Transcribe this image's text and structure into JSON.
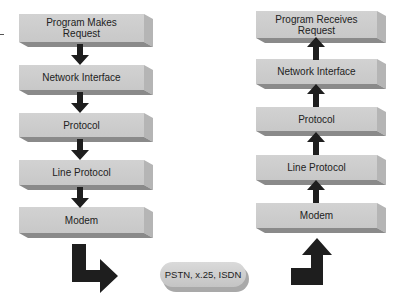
{
  "left_column": {
    "title": "Sending side",
    "boxes": [
      {
        "label_line1": "Program Makes",
        "label_line2": "Request"
      },
      {
        "label_line1": "Network Interface",
        "label_line2": ""
      },
      {
        "label_line1": "Protocol",
        "label_line2": ""
      },
      {
        "label_line1": "Line Protocol",
        "label_line2": ""
      },
      {
        "label_line1": "Modem",
        "label_line2": ""
      }
    ],
    "arrow_direction": "down"
  },
  "right_column": {
    "title": "Receiving side",
    "boxes": [
      {
        "label_line1": "Program Receives",
        "label_line2": "Request"
      },
      {
        "label_line1": "Network Interface",
        "label_line2": ""
      },
      {
        "label_line1": "Protocol",
        "label_line2": ""
      },
      {
        "label_line1": "Line Protocol",
        "label_line2": ""
      },
      {
        "label_line1": "Modem",
        "label_line2": ""
      }
    ],
    "arrow_direction": "up"
  },
  "network": {
    "label": "PSTN, x.25, ISDN"
  },
  "colors": {
    "box_face": "#cccccc",
    "box_shadow": "#8a8a8a",
    "arrow": "#1e1e1e"
  }
}
